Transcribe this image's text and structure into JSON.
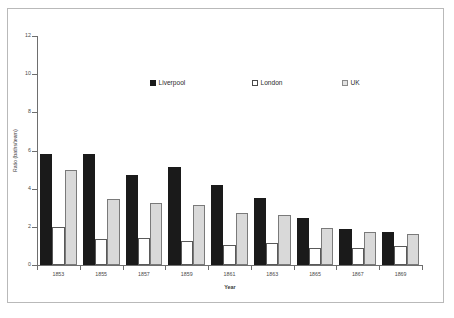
{
  "chart_data": {
    "type": "bar",
    "title": "",
    "xlabel": "Year",
    "ylabel": "Ratio (baths/team)",
    "ylim": [
      0,
      12
    ],
    "ytick_step": 2,
    "yticks": [
      0,
      2,
      4,
      6,
      8,
      10,
      12
    ],
    "grid": false,
    "legend_position": "upper-center-inside",
    "categories": [
      "1853",
      "1855",
      "1857",
      "1859",
      "1861",
      "1863",
      "1865",
      "1867",
      "1869"
    ],
    "series": [
      {
        "name": "Liverpool",
        "color": "#1a1a1a",
        "values": [
          5.8,
          5.8,
          4.7,
          5.15,
          4.2,
          3.5,
          2.45,
          1.9,
          1.75
        ]
      },
      {
        "name": "London",
        "color": "#ffffff",
        "values": [
          2.0,
          1.35,
          1.4,
          1.25,
          1.05,
          1.15,
          0.9,
          0.9,
          1.0
        ]
      },
      {
        "name": "UK",
        "color": "#d9d9d9",
        "values": [
          5.0,
          3.45,
          3.25,
          3.15,
          2.75,
          2.6,
          1.95,
          1.75,
          1.6
        ]
      }
    ]
  },
  "figure": {
    "frame_color": "#b9b9b9",
    "axis_color": "#6e6e6e",
    "background": "#ffffff"
  }
}
